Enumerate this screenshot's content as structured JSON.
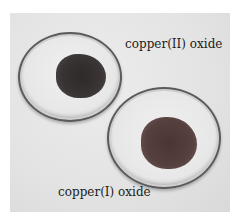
{
  "image": {
    "description": "Photograph of two glass dishes containing dark powders",
    "labels": {
      "top": "copper(II) oxide",
      "bottom": "copper(I) oxide"
    },
    "colors": {
      "background": "#e5e5e5",
      "copper_II_oxide": "#332e2e",
      "copper_I_oxide": "#4f3a38"
    }
  }
}
